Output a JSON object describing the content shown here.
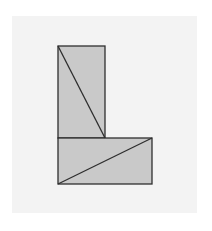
{
  "diagram": {
    "type": "geometric-figure",
    "colors": {
      "background": "#ffffff",
      "panel": "#f3f3f3",
      "fill": "#c9c9c9",
      "stroke": "#2e2e2e"
    },
    "shapes": [
      {
        "name": "upper-rectangle",
        "x": 58,
        "y": 46,
        "width": 47,
        "height": 92
      },
      {
        "name": "lower-rectangle",
        "x": 58,
        "y": 138,
        "width": 94,
        "height": 46
      }
    ],
    "diagonals": [
      {
        "name": "upper-diagonal",
        "x1": 58,
        "y1": 46,
        "x2": 105,
        "y2": 138
      },
      {
        "name": "lower-diagonal",
        "x1": 58,
        "y1": 184,
        "x2": 152,
        "y2": 138
      }
    ]
  }
}
